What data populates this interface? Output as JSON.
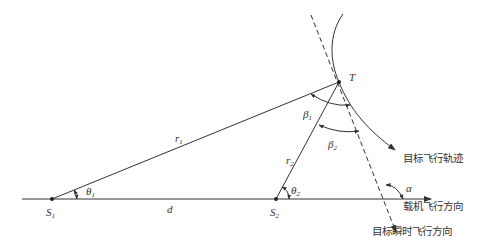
{
  "diagram": {
    "points": {
      "S1": {
        "label": "S",
        "sub": "1"
      },
      "S2": {
        "label": "S",
        "sub": "2"
      },
      "T": {
        "label": "T"
      }
    },
    "segments": {
      "r1": {
        "label": "r",
        "sub": "1"
      },
      "r2": {
        "label": "r",
        "sub": "2"
      },
      "d": {
        "label": "d"
      }
    },
    "angles": {
      "theta1": {
        "label": "θ",
        "sub": "1"
      },
      "theta2": {
        "label": "θ",
        "sub": "2"
      },
      "beta1": {
        "label": "β",
        "sub": "1"
      },
      "beta2": {
        "label": "β",
        "sub": "2"
      },
      "alpha": {
        "label": "α"
      }
    },
    "annotations": {
      "target_trajectory": "目标飞行轨迹",
      "carrier_direction": "载机飞行方向",
      "target_instant_direction": "目标瞬时飞行方向"
    },
    "colors": {
      "line": "#333333"
    }
  }
}
